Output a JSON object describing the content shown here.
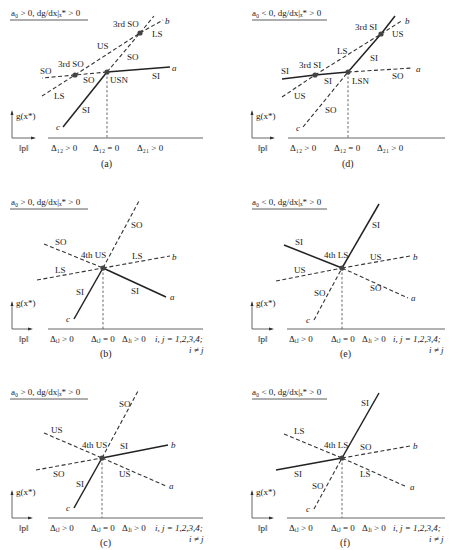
{
  "figure": {
    "axes": {
      "y_label": "g(x*)",
      "x_label": "‖p‖"
    },
    "panels": [
      {
        "id": "a",
        "caption": "(a)",
        "condition": "a₀ > 0, dg/dx|ₓ* > 0",
        "x_ticks": [
          "Δ₁₂ > 0",
          "Δ₁₂ = 0",
          "Δ₂₁ > 0"
        ],
        "branch_ends": {
          "a": "a",
          "b": "b",
          "c": "c"
        },
        "nodes": [
          "USN",
          "3rd SO",
          "3rd SO"
        ],
        "labels": {
          "left_so": "SO",
          "left_ls": "LS",
          "mid_so": "SO",
          "us": "US",
          "upper_so": "SO",
          "upper_ls": "LS",
          "si_c": "SI",
          "si_a": "SI",
          "node_main": "USN",
          "node_left": "3rd SO",
          "node_upper": "3rd SO"
        }
      },
      {
        "id": "d",
        "caption": "(d)",
        "condition": "a₀ < 0, dg/dx|ₓ* > 0",
        "x_ticks": [
          "Δ₁₂ > 0",
          "Δ₁₂ = 0",
          "Δ₂₁ > 0"
        ],
        "branch_ends": {
          "a": "a",
          "b": "b",
          "c": "c"
        },
        "nodes": [
          "LSN",
          "3rd SI",
          "3rd SI"
        ],
        "labels": {
          "left_si": "SI",
          "left_us": "US",
          "mid_si": "SI",
          "ls": "LS",
          "upper_si": "SI",
          "upper_us": "US",
          "so_c": "SO",
          "so_a": "SO",
          "node_main": "LSN",
          "node_left": "3rd SI",
          "node_upper": "3rd SI"
        }
      },
      {
        "id": "b",
        "caption": "(b)",
        "condition": "a₀ > 0, dg/dx|ₓ* > 0",
        "x_ticks": [
          "Δᵢⱼ > 0",
          "Δᵢⱼ = 0",
          "Δⱼᵢ > 0"
        ],
        "index_note": [
          "i, j = 1,2,3,4;",
          "i ≠ j"
        ],
        "branch_ends": {
          "a": "a",
          "b": "b",
          "c": "c"
        },
        "node": "4th US",
        "labels": {
          "so_top": "SO",
          "so_left": "SO",
          "ls_left": "LS",
          "ls_right": "LS",
          "si_c": "SI",
          "si_a": "SI"
        }
      },
      {
        "id": "e",
        "caption": "(e)",
        "condition": "a₀ < 0, dg/dx|ₓ* > 0",
        "x_ticks": [
          "Δᵢⱼ > 0",
          "Δᵢⱼ = 0",
          "Δⱼᵢ > 0"
        ],
        "index_note": [
          "i, j = 1,2,3,4;",
          "i ≠ j"
        ],
        "branch_ends": {
          "a": "a",
          "b": "b",
          "c": "c"
        },
        "node": "4th LS",
        "labels": {
          "si_top": "SI",
          "si_left": "SI",
          "us_left": "US",
          "us_right": "US",
          "so_c": "SO",
          "so_a": "SO"
        }
      },
      {
        "id": "c",
        "caption": "(c)",
        "condition": "a₀ > 0, dg/dx|ₓ* > 0",
        "x_ticks": [
          "Δᵢⱼ > 0",
          "Δᵢⱼ = 0",
          "Δⱼᵢ > 0"
        ],
        "index_note": [
          "i, j = 1,2,3,4;",
          "i ≠ j"
        ],
        "branch_ends": {
          "a": "a",
          "b": "b",
          "c": "c"
        },
        "node": "4th US",
        "labels": {
          "so_top": "SO",
          "us_left": "US",
          "so_left": "SO",
          "si_b": "SI",
          "us_a": "US",
          "si_c": "SI"
        }
      },
      {
        "id": "f",
        "caption": "(f)",
        "condition": "a₀ < 0, dg/dx|ₓ* > 0",
        "x_ticks": [
          "Δᵢⱼ > 0",
          "Δᵢⱼ = 0",
          "Δⱼᵢ > 0"
        ],
        "index_note": [
          "i, j = 1,2,3,4;",
          "i ≠ j"
        ],
        "branch_ends": {
          "a": "a",
          "b": "b",
          "c": "c"
        },
        "node": "4th LS",
        "labels": {
          "si_top": "SI",
          "ls_left": "LS",
          "si_left": "SI",
          "so_b": "SO",
          "ls_a": "LS",
          "so_c": "SO"
        }
      }
    ]
  }
}
